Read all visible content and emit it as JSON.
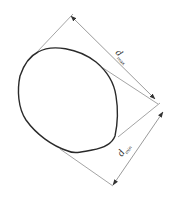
{
  "diagram": {
    "title": "",
    "shape": "particle-outline",
    "dimensions": [
      {
        "id": "max",
        "symbol": "d",
        "subscript": "max"
      },
      {
        "id": "min",
        "symbol": "d",
        "subscript": "min"
      }
    ],
    "colors": {
      "outline": "#2a2a2a",
      "dimension_lines": "#555555",
      "background": "#ffffff"
    }
  }
}
